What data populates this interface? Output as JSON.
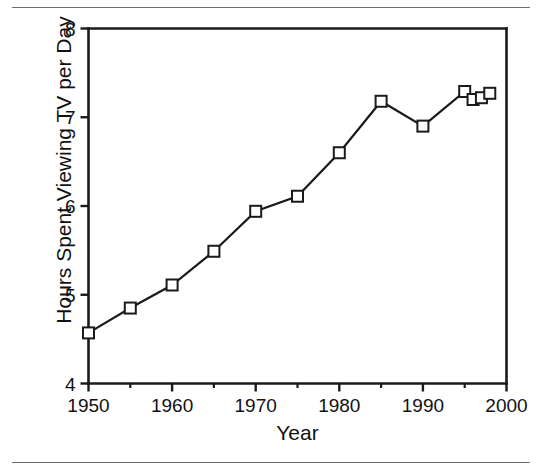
{
  "figure": {
    "background_color": "#ffffff",
    "ink_color": "#1a1a1a",
    "rule_color": "#6e6e6e"
  },
  "chart_data": {
    "type": "line",
    "title": "",
    "subtitle": "",
    "xlabel": "Year",
    "ylabel": "Hours Spent Viewing TV per Day",
    "xlim": [
      1950,
      2000
    ],
    "ylim": [
      4,
      8
    ],
    "xticks": [
      1950,
      1960,
      1970,
      1980,
      1990,
      2000
    ],
    "xtick_labels": [
      "1950",
      "1960",
      "1970",
      "1980",
      "1990",
      "2000"
    ],
    "xminor_ticks": [
      1955,
      1965,
      1975,
      1985,
      1995
    ],
    "yticks": [
      4,
      5,
      6,
      7,
      8
    ],
    "ytick_labels": [
      "4",
      "5",
      "6",
      "7",
      "8"
    ],
    "grid": false,
    "legend": null,
    "marker": "open-square",
    "line_color": "#1a1a1a",
    "marker_face_color": "#ffffff",
    "x": [
      1950,
      1955,
      1960,
      1965,
      1970,
      1975,
      1980,
      1985,
      1990,
      1995,
      1996,
      1997,
      1998
    ],
    "values": [
      4.57,
      4.85,
      5.11,
      5.49,
      5.94,
      6.11,
      6.6,
      7.18,
      6.9,
      7.29,
      7.2,
      7.22,
      7.27
    ],
    "series": [
      {
        "name": "Hours Spent Viewing TV per Day",
        "values": [
          4.57,
          4.85,
          5.11,
          5.49,
          5.94,
          6.11,
          6.6,
          7.18,
          6.9,
          7.29,
          7.2,
          7.22,
          7.27
        ]
      }
    ],
    "annotations": []
  }
}
